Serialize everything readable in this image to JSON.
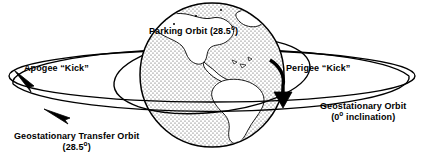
{
  "diagram": {
    "background_color": "#ffffff",
    "stroke_color": "#000000",
    "earth": {
      "name": "earth-globe",
      "center_x": 212,
      "center_y": 75,
      "radius": 72,
      "ocean_fill": "stipple-dots",
      "land_fill": "#ffffff",
      "landmass": "Americas"
    },
    "labels": {
      "parking_orbit": "Parking Orbit (28.5",
      "parking_orbit_sup": "o",
      "parking_orbit_tail": ")",
      "apogee_kick": "Apogee “Kick”",
      "perigee_kick": "Perigee “Kick”",
      "geostationary_orbit_line1": "Geostationary Orbit",
      "geostationary_orbit_line2_pre": "(0",
      "geostationary_orbit_line2_sup": "o",
      "geostationary_orbit_line2_post": " inclination)",
      "transfer_orbit_line1": "Geostationary Transfer Orbit",
      "transfer_orbit_line2_pre": "(28.5",
      "transfer_orbit_line2_sup": "o",
      "transfer_orbit_line2_post": ")"
    },
    "orbits": [
      {
        "name": "geostationary-orbit",
        "inclination_deg": 0,
        "shape": "ellipse",
        "cx": 212,
        "cy": 76,
        "rx": 203,
        "ry": 26,
        "rotation_deg": 0
      },
      {
        "name": "geostationary-transfer-orbit",
        "inclination_deg": 28.5,
        "shape": "ellipse",
        "cx": 212,
        "cy": 88,
        "rx": 200,
        "ry": 34,
        "rotation_deg": -5
      },
      {
        "name": "parking-orbit",
        "inclination_deg": 28.5,
        "shape": "ellipse",
        "cx": 212,
        "cy": 76,
        "rx": 80,
        "ry": 30,
        "rotation_deg": -18
      }
    ],
    "arrows": [
      {
        "name": "apogee-kick-arrow",
        "x": 26,
        "y": 82,
        "direction": "down-left"
      },
      {
        "name": "transfer-orbit-direction-arrow",
        "x": 62,
        "y": 113,
        "direction": "left"
      },
      {
        "name": "perigee-kick-arrow",
        "x": 281,
        "y": 92,
        "direction": "down"
      }
    ]
  }
}
